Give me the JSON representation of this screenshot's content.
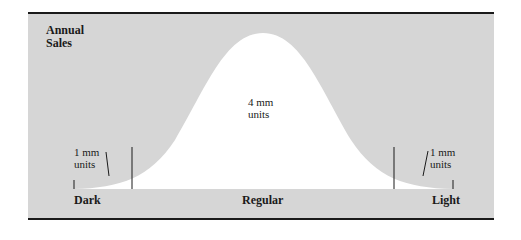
{
  "diagram": {
    "y_axis_label_line1": "Annual",
    "y_axis_label_line2": "Sales",
    "segments": [
      {
        "name": "Dark",
        "value_line1": "1 mm",
        "value_line2": "units"
      },
      {
        "name": "Regular",
        "value_line1": "4 mm",
        "value_line2": "units"
      },
      {
        "name": "Light",
        "value_line1": "1 mm",
        "value_line2": "units"
      }
    ],
    "colors": {
      "panel": "#d6d6d6",
      "curve_fill": "#ffffff",
      "lines": "#1a1a1a"
    },
    "shape": "bell curve"
  }
}
